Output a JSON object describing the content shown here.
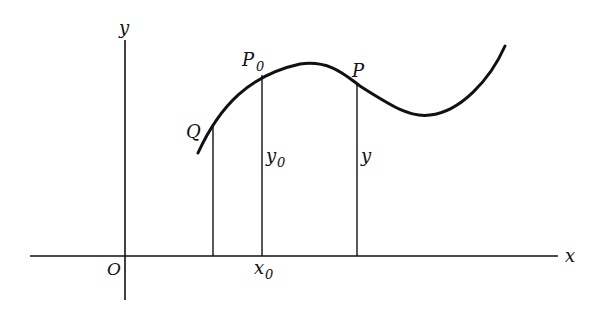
{
  "diagram": {
    "axes": {
      "x_label": "x",
      "y_label": "y",
      "origin_label": "O"
    },
    "points": {
      "Q": "Q",
      "P0": "P",
      "P0_sub": "0",
      "P": "P"
    },
    "ordinates": {
      "y0": "y",
      "y0_sub": "0",
      "y": "y"
    },
    "abscissa": {
      "x0": "x",
      "x0_sub": "0"
    },
    "colors": {
      "ink": "#111111",
      "background": "#ffffff"
    }
  }
}
